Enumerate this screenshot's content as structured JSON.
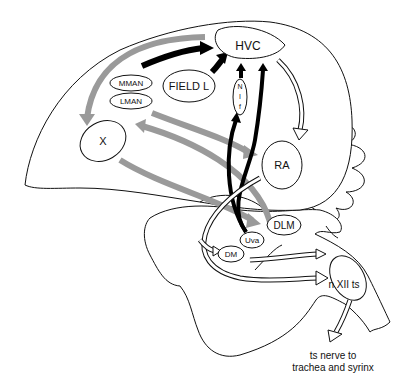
{
  "figure": {
    "nuclei": [
      {
        "id": "hvc",
        "label": "HVC"
      },
      {
        "id": "field-l",
        "label": "FIELD L"
      },
      {
        "id": "mman",
        "label": "MMAN"
      },
      {
        "id": "lman",
        "label": "LMAN"
      },
      {
        "id": "nif",
        "label": "N I f"
      },
      {
        "id": "x",
        "label": "X"
      },
      {
        "id": "ra",
        "label": "RA"
      },
      {
        "id": "dlm",
        "label": "DLM"
      },
      {
        "id": "uva",
        "label": "Uva"
      },
      {
        "id": "dm",
        "label": "DM"
      },
      {
        "id": "nxiits",
        "label": "n XII ts"
      }
    ],
    "nif_letters": [
      "N",
      "I",
      "f"
    ],
    "annotation_line1": "ts nerve to",
    "annotation_line2": "trachea and syrinx",
    "pathway_colors": {
      "black": "#000000",
      "gray": "#9a9a9a",
      "hollow": "#ffffff"
    }
  }
}
